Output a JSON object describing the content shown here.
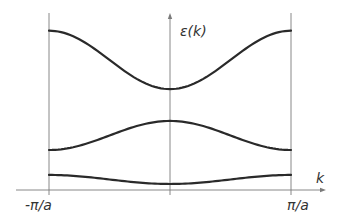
{
  "chart_data": {
    "type": "line",
    "title": "",
    "xlabel": "k",
    "ylabel": "ε(k)",
    "x_ticks": [
      {
        "value": -1,
        "label": "-π/a"
      },
      {
        "value": 1,
        "label": "π/a"
      }
    ],
    "xlim": [
      -1,
      1
    ],
    "ylim": [
      0,
      10
    ],
    "x_units": "π/a",
    "grid": false,
    "legend": "none",
    "series": [
      {
        "name": "band-1",
        "shape": "cosine",
        "edge_value": 0.85,
        "center_value": 0.34
      },
      {
        "name": "band-2",
        "shape": "cosine",
        "edge_value": 2.26,
        "center_value": 3.9
      },
      {
        "name": "band-3",
        "shape": "cosine",
        "edge_value": 9.0,
        "center_value": 5.7
      }
    ]
  },
  "colors": {
    "axis": "#7a7a7a",
    "band": "#2a2a2a",
    "text": "#333333"
  }
}
